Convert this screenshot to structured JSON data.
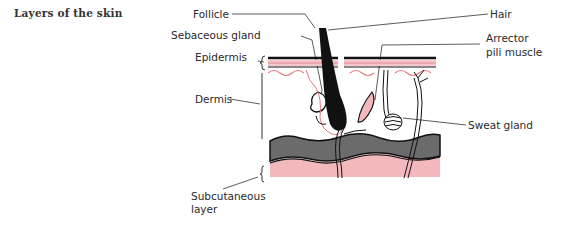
{
  "title": "Layers of the skin",
  "labels": {
    "follicle": "Follicle",
    "sebaceous_gland": "Sebaceous gland",
    "epidermis": "Epidermis",
    "dermis": "Dermis",
    "subcutaneous_1": "Subcutaneous",
    "subcutaneous_2": "layer",
    "hair": "Hair",
    "arrector_1": "Arrector",
    "arrector_2": "pili muscle",
    "sweat_gland": "Sweat gland"
  },
  "colors": {
    "pink": "#f2b8bc",
    "pink_line": "#e37a80",
    "gray": "#6b6b6b",
    "ink": "#111111"
  }
}
